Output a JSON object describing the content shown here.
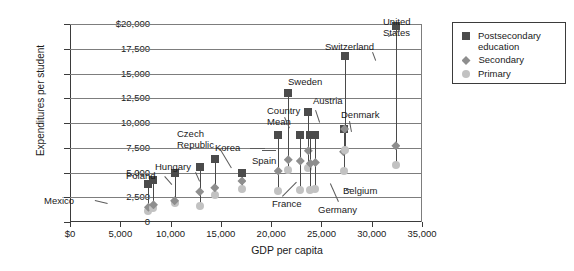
{
  "chart_data": {
    "type": "scatter",
    "title": "",
    "xlabel": "GDP per capita",
    "ylabel": "Expenditures per student",
    "xlim": [
      0,
      35000
    ],
    "ylim": [
      0,
      20000
    ],
    "grid": "horizontal",
    "legend_position": "right",
    "x_ticks": [
      "$0",
      "5,000",
      "10,000",
      "15,000",
      "20,000",
      "25,000",
      "30,000",
      "35,000"
    ],
    "x_tick_values": [
      0,
      5000,
      10000,
      15000,
      20000,
      25000,
      30000,
      35000
    ],
    "y_ticks": [
      "0",
      "2,500",
      "5,000",
      "7,500",
      "10,000",
      "12,500",
      "15,000",
      "17,500",
      "$20,000"
    ],
    "y_tick_values": [
      0,
      2500,
      5000,
      7500,
      10000,
      12500,
      15000,
      17500,
      20000
    ],
    "series": [
      {
        "name": "Postsecondary education",
        "marker": "square",
        "color": "#4b4b4b"
      },
      {
        "name": "Secondary",
        "marker": "diamond",
        "color": "#8e8e8e"
      },
      {
        "name": "Primary",
        "marker": "circle",
        "color": "#c2c2c2"
      }
    ],
    "points": [
      {
        "label": "Mexico",
        "gdp": 7800,
        "postsecondary": 3800,
        "secondary": 1500,
        "primary": 1100
      },
      {
        "label": "Poland",
        "gdp": 8300,
        "postsecondary": 4250,
        "secondary": 1750,
        "primary": 1450
      },
      {
        "label": "Hungary",
        "gdp": 10400,
        "postsecondary": 4950,
        "secondary": 2150,
        "primary": 1900
      },
      {
        "label": "Czech Republic",
        "gdp": 12900,
        "postsecondary": 5550,
        "secondary": 3050,
        "primary": 1600
      },
      {
        "label": "Korea",
        "gdp": 14400,
        "postsecondary": 6350,
        "secondary": 3450,
        "primary": 2750
      },
      {
        "label": "Spain",
        "gdp": 17100,
        "postsecondary": 5000,
        "secondary": 4150,
        "primary": 3300
      },
      {
        "label": "Country Mean",
        "gdp": 20700,
        "postsecondary": 8750,
        "secondary": 5150,
        "primary": 3150
      },
      {
        "label": "Sweden",
        "gdp": 21700,
        "postsecondary": 13050,
        "secondary": 6300,
        "primary": 5300
      },
      {
        "label": "France",
        "gdp": 22900,
        "postsecondary": 8750,
        "secondary": 6150,
        "primary": 3200
      },
      {
        "label": "Austria",
        "gdp": 23700,
        "postsecondary": 11100,
        "secondary": 7200,
        "primary": 5500
      },
      {
        "label": "Germany",
        "gdp": 23900,
        "postsecondary": 8750,
        "secondary": 5900,
        "primary": 3200
      },
      {
        "label": "Belgium",
        "gdp": 24400,
        "postsecondary": 8750,
        "secondary": 6000,
        "primary": 3300
      },
      {
        "label": "Denmark",
        "gdp": 27200,
        "postsecondary": 9400,
        "secondary": 7100,
        "primary": 5200
      },
      {
        "label": "Switzerland",
        "gdp": 27300,
        "postsecondary": 16800,
        "secondary": 9400,
        "primary": 7300
      },
      {
        "label": "United States",
        "gdp": 32400,
        "postsecondary": 19800,
        "secondary": 7700,
        "primary": 5800
      }
    ],
    "annotations": [
      {
        "text": "Mexico",
        "x": 44,
        "y": 196,
        "align": "left"
      },
      {
        "text": "Poland",
        "x": 126,
        "y": 171,
        "align": "left"
      },
      {
        "text": "Hungary",
        "x": 155,
        "y": 162,
        "align": "left"
      },
      {
        "text": "Czech\nRepublic",
        "x": 177,
        "y": 129,
        "align": "left"
      },
      {
        "text": "Korea",
        "x": 215,
        "y": 143,
        "align": "left"
      },
      {
        "text": "Spain",
        "x": 252,
        "y": 156,
        "align": "left"
      },
      {
        "text": "Country\nMean",
        "x": 267,
        "y": 106,
        "align": "left"
      },
      {
        "text": "Sweden",
        "x": 288,
        "y": 77,
        "align": "left"
      },
      {
        "text": "Austria",
        "x": 313,
        "y": 96,
        "align": "left"
      },
      {
        "text": "Denmark",
        "x": 341,
        "y": 110,
        "align": "left"
      },
      {
        "text": "Switzerland",
        "x": 325,
        "y": 42,
        "align": "left"
      },
      {
        "text": "United\nStates",
        "x": 383,
        "y": 17,
        "align": "left"
      },
      {
        "text": "France",
        "x": 272,
        "y": 199,
        "align": "left"
      },
      {
        "text": "Germany",
        "x": 318,
        "y": 205,
        "align": "left"
      },
      {
        "text": "Belgium",
        "x": 343,
        "y": 186,
        "align": "left"
      }
    ]
  },
  "legend": {
    "items": [
      {
        "label": "Postsecondary education",
        "marker": "post-square-icon"
      },
      {
        "label": "Secondary",
        "marker": "secondary-diamond-icon"
      },
      {
        "label": "Primary",
        "marker": "primary-circle-icon"
      }
    ]
  }
}
